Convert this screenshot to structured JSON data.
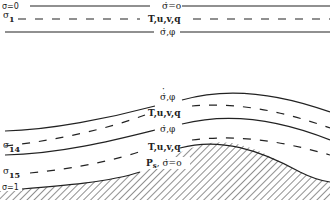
{
  "diagram": {
    "type": "sigma-coordinate vertical grid schematic",
    "top_levels": {
      "top_boundary": {
        "left_label": "σ=0",
        "center_label": "σ̇=o"
      },
      "level_1": {
        "left_label": "σ",
        "left_subscript": "1",
        "center_label": "T,u,v,q"
      },
      "interface_1": {
        "center_label": "σ̇,φ"
      }
    },
    "bottom_levels": {
      "interface_upper": {
        "center_label": "σ̇,φ"
      },
      "level_upper": {
        "center_label": "T,u,v,q"
      },
      "interface_lower": {
        "center_label": "σ̇,φ"
      },
      "level_14": {
        "left_label": "σ",
        "left_subscript": "14",
        "center_label": "T,u,v,q"
      },
      "level_15": {
        "left_label": "σ",
        "left_subscript": "15"
      },
      "surface": {
        "left_label": "σ=1",
        "center_label_main": "P",
        "center_label_sub": "s",
        "center_label_rest": ", σ̇=o"
      }
    },
    "legend": {
      "solid_line": "interface levels (σ̇, φ)",
      "dashed_line": "model levels (T,u,v,q)",
      "hatched": "terrain"
    }
  }
}
